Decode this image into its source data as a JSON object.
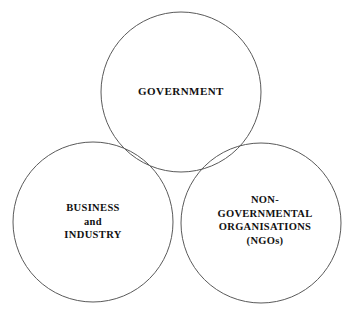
{
  "diagram": {
    "type": "venn",
    "background_color": "#ffffff",
    "stroke_color": "#5a5a5a",
    "text_color": "#111111",
    "circles": [
      {
        "id": "government",
        "cx": 181,
        "cy": 92,
        "r": 80,
        "label_lines": [
          "GOVERNMENT"
        ]
      },
      {
        "id": "business-industry",
        "cx": 93,
        "cy": 222,
        "r": 80,
        "label_lines": [
          "BUSINESS",
          "and",
          "INDUSTRY"
        ]
      },
      {
        "id": "ngo",
        "cx": 261,
        "cy": 223,
        "r": 80,
        "label_lines": [
          "NON-",
          "GOVERNMENTAL",
          "ORGANISATIONS",
          "(NGOs)"
        ]
      }
    ]
  },
  "labels": {
    "government": {
      "line1": "GOVERNMENT"
    },
    "business": {
      "line1": "BUSINESS",
      "line2": "and",
      "line3": "INDUSTRY"
    },
    "ngo": {
      "line1": "NON-",
      "line2": "GOVERNMENTAL",
      "line3": "ORGANISATIONS",
      "line4": "(NGOs)"
    }
  }
}
